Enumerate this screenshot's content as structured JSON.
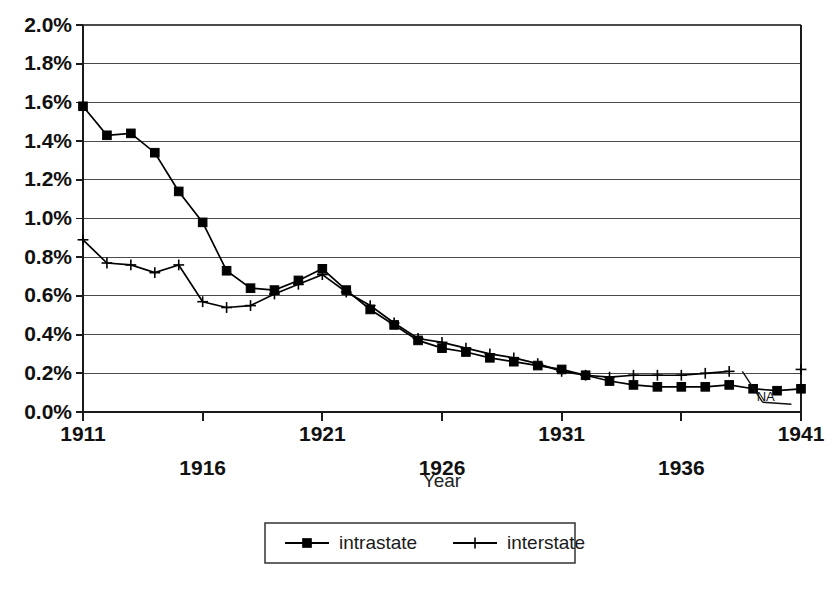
{
  "chart_data": {
    "type": "line",
    "title": "",
    "xlabel": "Year",
    "ylabel": "",
    "x": [
      1911,
      1912,
      1913,
      1914,
      1915,
      1916,
      1917,
      1918,
      1919,
      1920,
      1921,
      1922,
      1923,
      1924,
      1925,
      1926,
      1927,
      1928,
      1929,
      1930,
      1931,
      1932,
      1933,
      1934,
      1935,
      1936,
      1937,
      1938,
      1939,
      1940,
      1941
    ],
    "xlim": [
      1911,
      1941
    ],
    "ylim": [
      0.0,
      2.0
    ],
    "y_tick_step": 0.2,
    "y_unit": "%",
    "grid": "horizontal",
    "legend_position": "below-center",
    "x_tick_labels": [
      "1911",
      "1916",
      "1921",
      "1926",
      "1931",
      "1936",
      "1941"
    ],
    "x_tick_values": [
      1911,
      1916,
      1921,
      1926,
      1931,
      1936,
      1941
    ],
    "x_tick_stagger": [
      0,
      1,
      0,
      1,
      0,
      1,
      0
    ],
    "y_tick_labels": [
      "0.0%",
      "0.2%",
      "0.4%",
      "0.6%",
      "0.8%",
      "1.0%",
      "1.2%",
      "1.4%",
      "1.6%",
      "1.8%",
      "2.0%"
    ],
    "y_tick_values": [
      0.0,
      0.2,
      0.4,
      0.6,
      0.8,
      1.0,
      1.2,
      1.4,
      1.6,
      1.8,
      2.0
    ],
    "series": [
      {
        "name": "intrastate",
        "marker": "filled-square",
        "color": "#000000",
        "values": [
          1.58,
          1.43,
          1.44,
          1.34,
          1.14,
          0.98,
          0.73,
          0.64,
          0.63,
          0.68,
          0.74,
          0.63,
          0.53,
          0.45,
          0.37,
          0.33,
          0.31,
          0.28,
          0.26,
          0.24,
          0.22,
          0.19,
          0.16,
          0.14,
          0.13,
          0.13,
          0.13,
          0.14,
          0.12,
          0.11,
          0.12
        ]
      },
      {
        "name": "interstate",
        "marker": "plus-cross",
        "color": "#000000",
        "values": [
          0.89,
          0.77,
          0.76,
          0.72,
          0.76,
          0.57,
          0.54,
          0.55,
          0.61,
          0.66,
          0.71,
          0.62,
          0.55,
          0.46,
          0.38,
          0.36,
          0.33,
          0.3,
          0.28,
          0.25,
          0.21,
          0.19,
          0.18,
          0.19,
          0.19,
          0.19,
          0.2,
          0.21,
          null,
          null,
          0.22
        ]
      }
    ],
    "annotations": [
      {
        "text": "NA",
        "x": 1939.4,
        "y": 0.05,
        "note": "interstate data not available",
        "leader_targets": [
          [
            1938.55,
            0.21
          ],
          [
            1940.6,
            0.04
          ]
        ]
      }
    ]
  },
  "legend": {
    "items": [
      {
        "label": "intrastate",
        "marker": "filled-square"
      },
      {
        "label": "interstate",
        "marker": "plus-cross"
      }
    ]
  }
}
